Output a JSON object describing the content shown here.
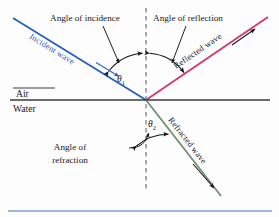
{
  "figure": {
    "type": "optics-ray-diagram",
    "title_visible": false,
    "labels": {
      "angle_of_incidence": "Angle of incidence",
      "angle_of_reflection": "Angle of reflection",
      "angle_of_refraction_line1": "Angle of",
      "angle_of_refraction_line2": "refraction",
      "incident_wave": "Incident wave",
      "reflected_wave": "Reflected wave",
      "refracted_wave": "Refracted wave",
      "medium_top": "Air",
      "medium_bottom": "Water",
      "theta1": "θ",
      "theta1_sub": "1",
      "theta2": "θ",
      "theta2_sub": "2"
    },
    "colors": {
      "incident_ray": "#2a5fbf",
      "reflected_ray": "#d6386a",
      "refracted_ray": "#6f9070",
      "interface_line": "#3a3a3a",
      "normal_dashed": "#6b6b6b",
      "leader_lines": "#141414",
      "text": "#1a1a1a",
      "bottom_rule": "#4a6fb5",
      "background": "#fdfdfd"
    },
    "geometry": {
      "origin": [
        146,
        100
      ],
      "incident_start": [
        13,
        18
      ],
      "reflected_end": [
        268,
        17
      ],
      "refracted_end": [
        221,
        196
      ],
      "interface_x_start": 10,
      "interface_x_end": 270,
      "interface_y": 100,
      "normal_x": 146,
      "normal_y_top": 8,
      "normal_y_bottom": 191
    }
  }
}
